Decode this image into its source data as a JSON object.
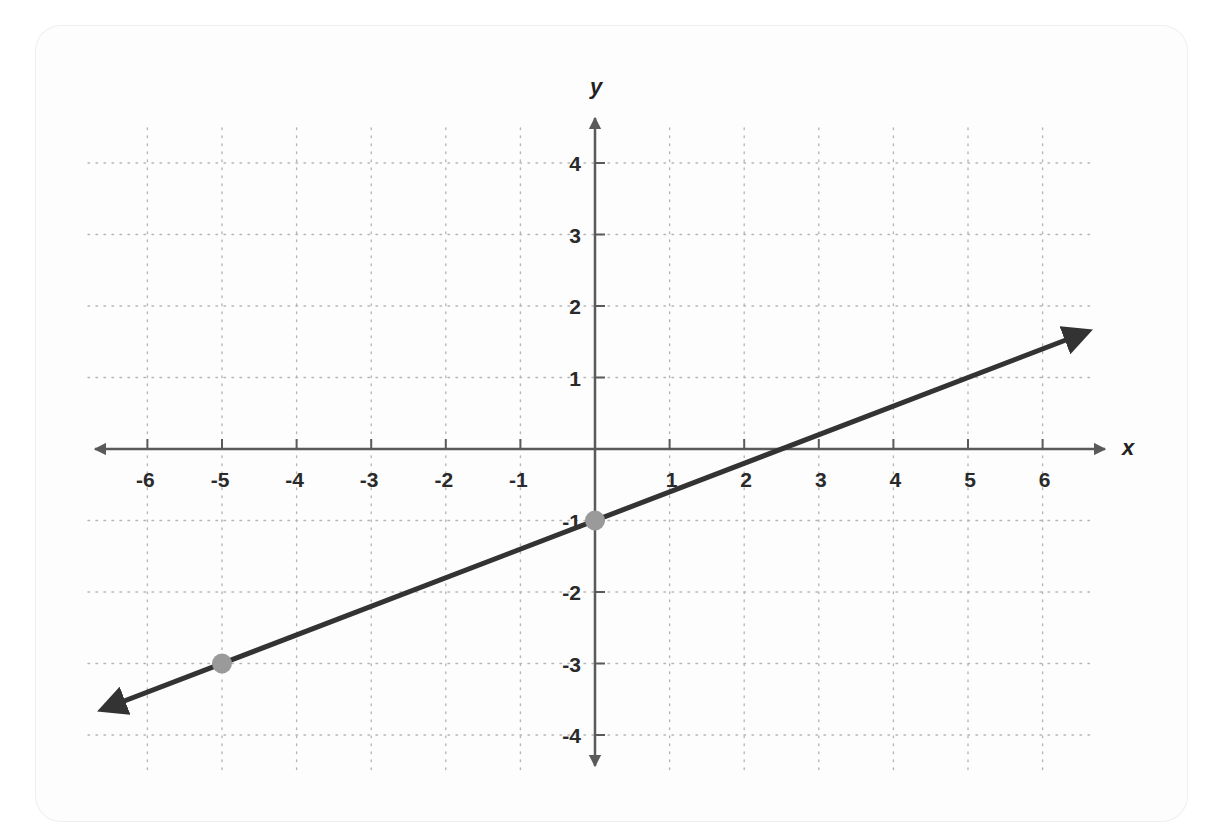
{
  "chart_data": {
    "type": "line",
    "title": "",
    "xlabel": "x",
    "ylabel": "y",
    "xlim": [
      -6,
      6
    ],
    "ylim": [
      -4,
      4
    ],
    "x_ticks": [
      -6,
      -5,
      -4,
      -3,
      -2,
      -1,
      1,
      2,
      3,
      4,
      5,
      6
    ],
    "y_ticks": [
      4,
      3,
      2,
      1,
      -1,
      -2,
      -3,
      -4
    ],
    "grid": true,
    "grid_style": "dotted",
    "series": [
      {
        "name": "line",
        "equation": "y = (2/5)x - 1",
        "slope": 0.4,
        "intercept": -1,
        "x": [
          -6.6,
          6.6
        ],
        "y": [
          -3.64,
          1.64
        ],
        "arrows_both_ends": true,
        "color": "#333333"
      }
    ],
    "points": [
      {
        "x": 0,
        "y": -1,
        "color": "#9a9a9a"
      },
      {
        "x": -5,
        "y": -3,
        "color": "#9a9a9a"
      }
    ]
  },
  "colors": {
    "axis": "#5a5a5a",
    "line": "#333333",
    "point": "#9a9a9a",
    "grid": "#b5b5b5"
  }
}
